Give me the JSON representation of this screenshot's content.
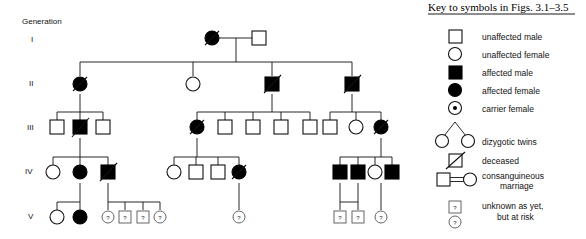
{
  "pedigree": {
    "generation_header": "Generation",
    "generation_labels": [
      "I",
      "II",
      "III",
      "IV",
      "V"
    ],
    "symbols": {
      "unknown_marker": "?"
    },
    "individuals": {
      "gen1": [
        {
          "id": "I-1",
          "shape": "circle",
          "status": "affected",
          "deceased": true
        },
        {
          "id": "I-2",
          "shape": "square",
          "status": "unaffected",
          "deceased": false
        }
      ],
      "gen2": [
        {
          "id": "II-1",
          "shape": "circle",
          "status": "affected",
          "deceased": true
        },
        {
          "id": "II-2",
          "shape": "circle",
          "status": "unaffected",
          "deceased": false
        },
        {
          "id": "II-3",
          "shape": "square",
          "status": "affected",
          "deceased": true
        },
        {
          "id": "II-4",
          "shape": "square",
          "status": "affected",
          "deceased": true
        }
      ],
      "gen3": [
        {
          "id": "III-1",
          "shape": "square",
          "status": "unaffected",
          "deceased": false
        },
        {
          "id": "III-2",
          "shape": "square",
          "status": "affected",
          "deceased": true
        },
        {
          "id": "III-3",
          "shape": "square",
          "status": "unaffected",
          "deceased": false
        },
        {
          "id": "III-4",
          "shape": "circle",
          "status": "affected",
          "deceased": true
        },
        {
          "id": "III-5",
          "shape": "square",
          "status": "unaffected",
          "deceased": false
        },
        {
          "id": "III-6",
          "shape": "square",
          "status": "unaffected",
          "deceased": false
        },
        {
          "id": "III-7",
          "shape": "square",
          "status": "unaffected",
          "deceased": false
        },
        {
          "id": "III-8",
          "shape": "square",
          "status": "unaffected",
          "deceased": false
        },
        {
          "id": "III-9",
          "shape": "square",
          "status": "unaffected",
          "deceased": false
        },
        {
          "id": "III-10",
          "shape": "circle",
          "status": "unaffected",
          "deceased": false
        },
        {
          "id": "III-11",
          "shape": "circle",
          "status": "affected",
          "deceased": true
        }
      ],
      "gen4": [
        {
          "id": "IV-1",
          "shape": "circle",
          "status": "unaffected",
          "deceased": false
        },
        {
          "id": "IV-2",
          "shape": "circle",
          "status": "affected",
          "deceased": false
        },
        {
          "id": "IV-3",
          "shape": "square",
          "status": "affected",
          "deceased": true
        },
        {
          "id": "IV-4",
          "shape": "circle",
          "status": "unaffected",
          "deceased": false
        },
        {
          "id": "IV-5",
          "shape": "square",
          "status": "unaffected",
          "deceased": false
        },
        {
          "id": "IV-6",
          "shape": "square",
          "status": "unaffected",
          "deceased": false
        },
        {
          "id": "IV-7",
          "shape": "circle",
          "status": "affected",
          "deceased": true
        },
        {
          "id": "IV-8",
          "shape": "square",
          "status": "affected",
          "deceased": false
        },
        {
          "id": "IV-9",
          "shape": "square",
          "status": "affected",
          "deceased": false
        },
        {
          "id": "IV-10",
          "shape": "circle",
          "status": "unaffected",
          "deceased": false
        },
        {
          "id": "IV-11",
          "shape": "square",
          "status": "affected",
          "deceased": false
        }
      ],
      "gen5": [
        {
          "id": "V-1",
          "shape": "circle",
          "status": "unaffected",
          "deceased": false
        },
        {
          "id": "V-2",
          "shape": "circle",
          "status": "affected",
          "deceased": false
        },
        {
          "id": "V-3",
          "shape": "circle",
          "status": "unknown",
          "deceased": false
        },
        {
          "id": "V-4",
          "shape": "square",
          "status": "unknown",
          "deceased": false
        },
        {
          "id": "V-5",
          "shape": "square",
          "status": "unknown",
          "deceased": false
        },
        {
          "id": "V-6",
          "shape": "circle",
          "status": "unknown",
          "deceased": false
        },
        {
          "id": "V-7",
          "shape": "circle",
          "status": "unknown",
          "deceased": false
        },
        {
          "id": "V-8",
          "shape": "square",
          "status": "unknown",
          "deceased": false
        },
        {
          "id": "V-9",
          "shape": "square",
          "status": "unknown",
          "deceased": false
        },
        {
          "id": "V-10",
          "shape": "circle",
          "status": "unknown",
          "deceased": false
        }
      ]
    }
  },
  "key": {
    "title": "Key to symbols in Figs. 3.1–3.5",
    "entries": [
      {
        "symbol": "unaffected-male-icon",
        "label": "unaffected male"
      },
      {
        "symbol": "unaffected-female-icon",
        "label": "unaffected female"
      },
      {
        "symbol": "affected-male-icon",
        "label": "affected male"
      },
      {
        "symbol": "affected-female-icon",
        "label": "affected female"
      },
      {
        "symbol": "carrier-female-icon",
        "label": "carrier female"
      },
      {
        "symbol": "dizygotic-twins-icon",
        "label": "dizygotic twins"
      },
      {
        "symbol": "deceased-icon",
        "label": "deceased"
      },
      {
        "symbol": "consanguineous-marriage-icon",
        "label": "consanguineous"
      },
      {
        "symbol": "consanguineous-marriage-icon-line2",
        "label": "marriage"
      },
      {
        "symbol": "unknown-at-risk-icon",
        "label": "unknown as yet,"
      },
      {
        "symbol": "unknown-at-risk-icon-line2",
        "label": "but at risk"
      }
    ]
  }
}
